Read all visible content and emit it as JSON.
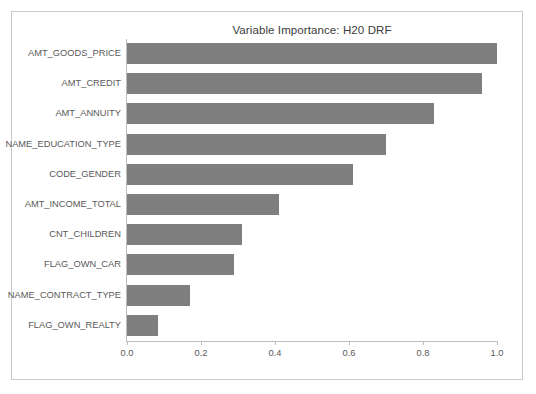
{
  "figure": {
    "title": "Variable Importance: H20 DRF",
    "bar_color": "#7f7f7f",
    "axis_color": "#bdbdbd",
    "frame_color": "#c9c9c9",
    "background": "#ffffff"
  },
  "chart_data": {
    "type": "bar",
    "orientation": "horizontal",
    "title": "Variable Importance: H20 DRF",
    "xlabel": "",
    "ylabel": "",
    "xlim": [
      0.0,
      1.0
    ],
    "grid": false,
    "legend": null,
    "xticks": [
      "0.0",
      "0.2",
      "0.4",
      "0.6",
      "0.8",
      "1.0"
    ],
    "xtick_values": [
      0.0,
      0.2,
      0.4,
      0.6,
      0.8,
      1.0
    ],
    "categories": [
      "AMT_GOODS_PRICE",
      "AMT_CREDIT",
      "AMT_ANNUITY",
      "NAME_EDUCATION_TYPE",
      "CODE_GENDER",
      "AMT_INCOME_TOTAL",
      "CNT_CHILDREN",
      "FLAG_OWN_CAR",
      "NAME_CONTRACT_TYPE",
      "FLAG_OWN_REALTY"
    ],
    "values": [
      1.0,
      0.96,
      0.83,
      0.7,
      0.61,
      0.41,
      0.31,
      0.29,
      0.17,
      0.085
    ]
  }
}
